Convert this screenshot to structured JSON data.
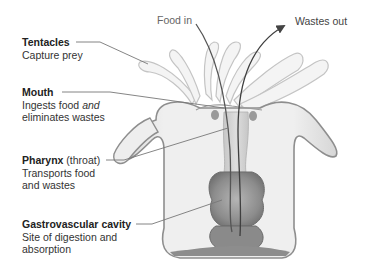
{
  "diagram": {
    "labels": [
      {
        "id": "tentacles",
        "title": "Tentacles",
        "title_suffix": "",
        "lines": [
          "Capture prey"
        ]
      },
      {
        "id": "mouth",
        "title": "Mouth",
        "title_suffix": "",
        "line1_pre": "Ingests food ",
        "line1_em": "and",
        "lines": [
          "eliminates wastes"
        ]
      },
      {
        "id": "pharynx",
        "title": "Pharynx",
        "title_suffix": " (throat)",
        "lines": [
          "Transports food",
          "and wastes"
        ]
      },
      {
        "id": "gastrovascular",
        "title": "Gastrovascular cavity",
        "title_suffix": "",
        "lines": [
          "Site of digestion and",
          "absorption"
        ]
      }
    ],
    "flows": {
      "food_in": "Food in",
      "wastes_out": "Wastes out"
    },
    "colors": {
      "outline": "#8a8a8a",
      "body_fill": "#ececec",
      "tentacle_fill": "#f3f3f3",
      "inner_dark": "#7d7d7d",
      "leader_line": "#777777",
      "flow_line": "#555555"
    }
  }
}
